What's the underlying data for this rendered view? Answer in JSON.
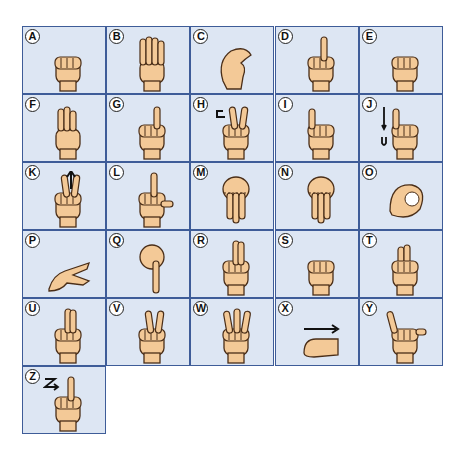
{
  "colors": {
    "cell_bg": "#dde6f3",
    "border": "#3e5c98",
    "skin": "#f3c997",
    "outline": "#4a2e18",
    "arrow": "#111111"
  },
  "letters": [
    {
      "letter": "A",
      "hand": "fist-thumb-side",
      "motion": ""
    },
    {
      "letter": "B",
      "hand": "flat-hand-fingers-up",
      "motion": ""
    },
    {
      "letter": "C",
      "hand": "curved-c-shape",
      "motion": ""
    },
    {
      "letter": "D",
      "hand": "index-up-circle",
      "motion": ""
    },
    {
      "letter": "E",
      "hand": "fingers-curled-thumb-tucked",
      "motion": ""
    },
    {
      "letter": "F",
      "hand": "ok-three-fingers-up",
      "motion": ""
    },
    {
      "letter": "G",
      "hand": "index-pointing",
      "motion": ""
    },
    {
      "letter": "H",
      "hand": "two-fingers-sideways",
      "motion": "hook-arrow"
    },
    {
      "letter": "I",
      "hand": "pinky-up",
      "motion": ""
    },
    {
      "letter": "J",
      "hand": "pinky-up",
      "motion": "j-arrow"
    },
    {
      "letter": "K",
      "hand": "two-fingers-up-thumb-between",
      "motion": "up-arrow"
    },
    {
      "letter": "L",
      "hand": "l-shape",
      "motion": ""
    },
    {
      "letter": "M",
      "hand": "three-fingers-down",
      "motion": ""
    },
    {
      "letter": "N",
      "hand": "two-fingers-down",
      "motion": ""
    },
    {
      "letter": "O",
      "hand": "o-shape",
      "motion": ""
    },
    {
      "letter": "P",
      "hand": "k-pointing-down",
      "motion": ""
    },
    {
      "letter": "Q",
      "hand": "g-pointing-down",
      "motion": ""
    },
    {
      "letter": "R",
      "hand": "crossed-fingers",
      "motion": ""
    },
    {
      "letter": "S",
      "hand": "fist-thumb-over",
      "motion": ""
    },
    {
      "letter": "T",
      "hand": "thumb-between-fingers",
      "motion": ""
    },
    {
      "letter": "U",
      "hand": "two-fingers-together-up",
      "motion": ""
    },
    {
      "letter": "V",
      "hand": "v-sign",
      "motion": ""
    },
    {
      "letter": "W",
      "hand": "three-fingers-up",
      "motion": ""
    },
    {
      "letter": "X",
      "hand": "hooked-index",
      "motion": "right-arrow"
    },
    {
      "letter": "Y",
      "hand": "thumb-pinky-out",
      "motion": ""
    },
    {
      "letter": "Z",
      "hand": "index-up",
      "motion": "z-arrow"
    }
  ]
}
